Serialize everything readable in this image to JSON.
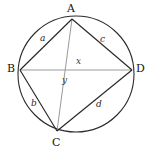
{
  "figure": {
    "kind": "cyclic-quadrilateral-in-circle",
    "background_color": "#ffffff",
    "circle": {
      "name": "circumscribed-circle",
      "center_x": 76,
      "center_y": 74,
      "radius": 58,
      "stroke_color": "#2b2b2b",
      "stroke_width": 1.1
    },
    "vertices": [
      {
        "id": "A",
        "label": "A",
        "x": 72,
        "y": 19,
        "label_x": 67,
        "label_y": 3
      },
      {
        "id": "B",
        "label": "B",
        "x": 20,
        "y": 70,
        "label_x": 7,
        "label_y": 63
      },
      {
        "id": "C",
        "label": "C",
        "x": 57,
        "y": 131,
        "label_x": 52,
        "label_y": 137
      },
      {
        "id": "D",
        "label": "D",
        "x": 132,
        "y": 70,
        "label_x": 136,
        "label_y": 63
      }
    ],
    "sides": [
      {
        "id": "AB",
        "label": "a",
        "from": "A",
        "to": "B",
        "label_x": 40,
        "label_y": 34,
        "stroke_color": "#262626",
        "stroke_width": 1.15
      },
      {
        "id": "BC",
        "label": "b",
        "from": "B",
        "to": "C",
        "label_x": 31,
        "label_y": 99,
        "stroke_color": "#262626",
        "stroke_width": 1.15
      },
      {
        "id": "CD",
        "label": "d",
        "from": "C",
        "to": "D",
        "label_x": 96,
        "label_y": 100,
        "stroke_color": "#262626",
        "stroke_width": 1.15
      },
      {
        "id": "DA",
        "label": "c",
        "from": "D",
        "to": "A",
        "label_x": 100,
        "label_y": 35,
        "stroke_color": "#262626",
        "stroke_width": 1.15
      }
    ],
    "diagonals": [
      {
        "id": "BD",
        "label": "x",
        "from": "B",
        "to": "D",
        "label_x": 76,
        "label_y": 57,
        "stroke_color": "#9a9a9a",
        "stroke_width": 1.0
      },
      {
        "id": "AC",
        "label": "y",
        "from": "A",
        "to": "C",
        "label_x": 62,
        "label_y": 76,
        "stroke_color": "#9a9a9a",
        "stroke_width": 1.0
      }
    ]
  }
}
